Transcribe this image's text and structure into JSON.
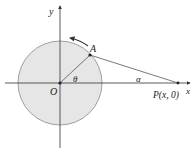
{
  "diagram": {
    "labels": {
      "y_axis": "y",
      "x_axis": "x",
      "origin": "O",
      "point_a": "A",
      "point_p": "P(x, 0)",
      "angle_theta": "θ",
      "angle_alpha": "α"
    },
    "colors": {
      "circle_fill": "#e6e6e6",
      "circle_stroke": "#8a8a8a",
      "axis": "#333333",
      "line": "#555555",
      "point": "#222222"
    },
    "geometry": {
      "origin": [
        60,
        83
      ],
      "radius": 42,
      "point_a": [
        90,
        55
      ],
      "point_p": [
        178,
        83
      ]
    }
  }
}
